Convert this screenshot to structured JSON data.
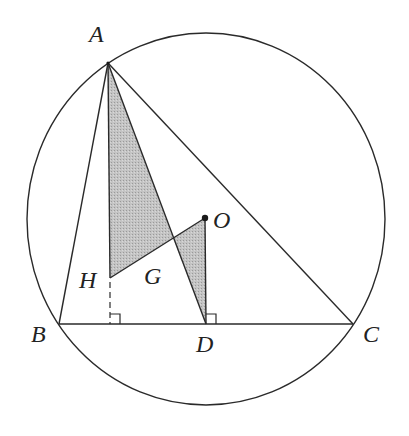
{
  "diagram": {
    "type": "geometry",
    "colors": {
      "stroke": "#2a2a2a",
      "shade": "#bdbdbd",
      "background": "#ffffff"
    },
    "circle": {
      "cx": 206,
      "cy": 219,
      "rx": 179,
      "ry": 186
    },
    "points": {
      "A": {
        "label": "A",
        "x": 108,
        "y": 63
      },
      "B": {
        "label": "B",
        "x": 59,
        "y": 324
      },
      "C": {
        "label": "C",
        "x": 353,
        "y": 324
      },
      "D": {
        "label": "D",
        "x": 206,
        "y": 324
      },
      "O": {
        "label": "O",
        "x": 205,
        "y": 218
      },
      "H": {
        "label": "H",
        "x": 110,
        "y": 278
      },
      "G": {
        "label": "G",
        "x": 173,
        "y": 238
      }
    },
    "labels": [
      {
        "id": "A",
        "text": "A",
        "x": 89,
        "y": 22
      },
      {
        "id": "B",
        "text": "B",
        "x": 31,
        "y": 322
      },
      {
        "id": "C",
        "text": "C",
        "x": 363,
        "y": 322
      },
      {
        "id": "D",
        "text": "D",
        "x": 196,
        "y": 332
      },
      {
        "id": "O",
        "text": "O",
        "x": 213,
        "y": 208
      },
      {
        "id": "H",
        "text": "H",
        "x": 79,
        "y": 268
      },
      {
        "id": "G",
        "text": "G",
        "x": 144,
        "y": 264
      }
    ]
  }
}
